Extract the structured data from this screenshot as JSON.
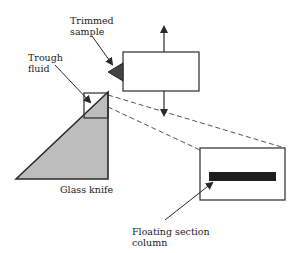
{
  "diagram": {
    "labels": {
      "trimmed_sample_line1": "Trimmed",
      "trimmed_sample_line2": "sample",
      "trough_fluid_line1": "Trough",
      "trough_fluid_line2": "fluid",
      "glass_knife": "Glass knife",
      "floating_section_line1": "Floating section",
      "floating_section_line2": "column"
    },
    "side_text": "",
    "colors": {
      "line": "#2a2a2a",
      "knife_fill": "#bdbdbd",
      "sample_fill": "#444444",
      "section_bar": "#1e1e1e",
      "dash": "#555555"
    }
  }
}
